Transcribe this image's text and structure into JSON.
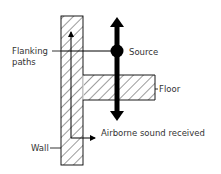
{
  "diagram": {
    "type": "acoustic-flanking-transmission",
    "labels": {
      "flanking_line1": "Flanking",
      "flanking_line2": "paths",
      "source": "Source",
      "floor": "Floor",
      "airborne": "Airborne sound received",
      "wall": "Wall"
    },
    "colors": {
      "stroke": "#000000",
      "text": "#333333",
      "hatch": "#222222",
      "background": "#ffffff"
    }
  }
}
